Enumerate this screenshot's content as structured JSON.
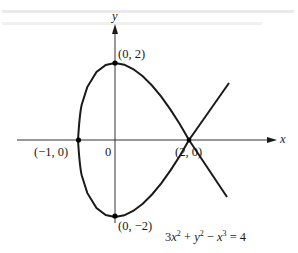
{
  "figure": {
    "type": "curve-plot",
    "equation_label": {
      "term1_coef": "3",
      "term1_var": "x",
      "term1_exp": "2",
      "plus": " + ",
      "term2_var": "y",
      "term2_exp": "2",
      "minus": " − ",
      "term3_var": "x",
      "term3_exp": "3",
      "equals": " = 4"
    },
    "axes": {
      "x_label": "x",
      "y_label": "y",
      "origin_label": "0"
    },
    "points": [
      {
        "id": "top",
        "label": "(0, 2)",
        "x": 0,
        "y": 2
      },
      {
        "id": "left",
        "label": "(−1, 0)",
        "x": -1,
        "y": 0
      },
      {
        "id": "node",
        "label": "(2, 0)",
        "x": 2,
        "y": 0
      },
      {
        "id": "bottom",
        "label": "(0, −2)",
        "x": 0,
        "y": -2
      }
    ],
    "colors": {
      "curve": "#1a1a1a",
      "axes": "#333333",
      "background": "#ffffff"
    }
  }
}
